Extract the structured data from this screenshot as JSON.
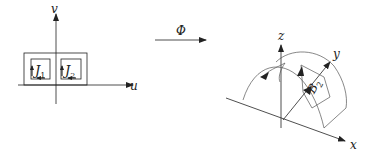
{
  "figure": {
    "domain_plane": {
      "axis_labels": {
        "horizontal": "u",
        "vertical": "v"
      },
      "regions": [
        {
          "name": "J",
          "subscript": "1"
        },
        {
          "name": "J",
          "subscript": "2"
        }
      ]
    },
    "mapping": {
      "label": "Φ"
    },
    "surface": {
      "axis_labels": {
        "x": "x",
        "y": "y",
        "z": "z"
      },
      "region": {
        "name": "B",
        "subscript": "2"
      }
    },
    "colors": {
      "ink": "#222222",
      "background": "#ffffff"
    }
  }
}
